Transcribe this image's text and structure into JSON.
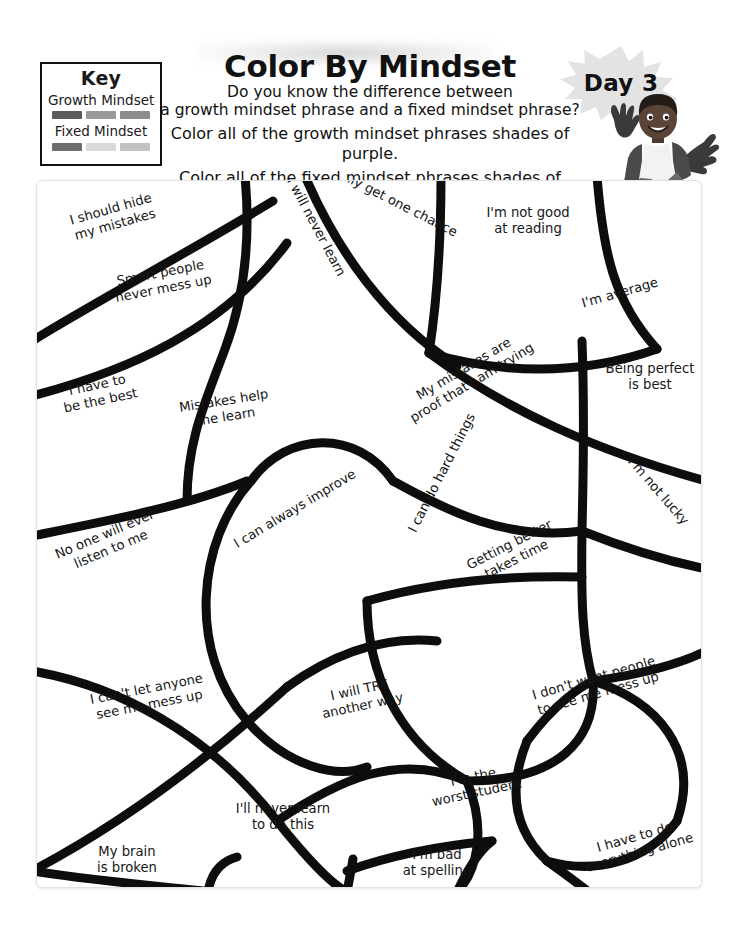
{
  "header": {
    "title": "Color By Mindset",
    "subtitle_line1": "Do you know the difference between",
    "subtitle_line2": "a growth mindset phrase and a fixed mindset phrase?",
    "instruction_line1": "Color all of the growth mindset phrases shades of purple.",
    "instruction_line2": "Color all of the fixed mindset phrases shades of blue.",
    "day_badge": "Day 3"
  },
  "key": {
    "title": "Key",
    "growth_label": "Growth Mindset",
    "fixed_label": "Fixed Mindset",
    "growth_swatches": [
      "#5b5b5b",
      "#9a9a9a",
      "#8d8d8d"
    ],
    "fixed_swatches": [
      "#6d6d6d",
      "#d9d9d9",
      "#c2c2c2"
    ]
  },
  "puzzle": {
    "regions": [
      {
        "text": "I should hide\nmy mistakes",
        "type": "fixed",
        "x": 52,
        "y": 200,
        "w": 120,
        "rot": -16
      },
      {
        "text": "Smart people\nnever mess up",
        "type": "fixed",
        "x": 96,
        "y": 264,
        "w": 130,
        "rot": -11
      },
      {
        "text": "I will never learn",
        "type": "fixed",
        "x": 250,
        "y": 218,
        "w": 130,
        "rot": 62
      },
      {
        "text": "I only get one chance",
        "type": "fixed",
        "x": 312,
        "y": 192,
        "w": 160,
        "rot": 27
      },
      {
        "text": "I'm not good\nat reading",
        "type": "fixed",
        "x": 467,
        "y": 204,
        "w": 120,
        "rot": 0
      },
      {
        "text": "I'm average",
        "type": "fixed",
        "x": 569,
        "y": 284,
        "w": 100,
        "rot": -16
      },
      {
        "text": "I have to\nbe the best",
        "type": "fixed",
        "x": 46,
        "y": 376,
        "w": 104,
        "rot": -12
      },
      {
        "text": "Mistakes help\nme learn",
        "type": "growth",
        "x": 159,
        "y": 392,
        "w": 130,
        "rot": -9
      },
      {
        "text": "My mistakes are\nproof that I am trying",
        "type": "growth",
        "x": 387,
        "y": 359,
        "w": 160,
        "rot": -31
      },
      {
        "text": "Being perfect\nis best",
        "type": "fixed",
        "x": 589,
        "y": 360,
        "w": 120,
        "rot": 0
      },
      {
        "text": "No one will ever\nlisten to me",
        "type": "fixed",
        "x": 42,
        "y": 525,
        "w": 130,
        "rot": -23
      },
      {
        "text": "I can always improve",
        "type": "growth",
        "x": 214,
        "y": 500,
        "w": 160,
        "rot": -31
      },
      {
        "text": "I can do hard things",
        "type": "growth",
        "x": 366,
        "y": 464,
        "w": 150,
        "rot": -63
      },
      {
        "text": "Getting better\ntakes time",
        "type": "growth",
        "x": 452,
        "y": 535,
        "w": 120,
        "rot": -27
      },
      {
        "text": "I'm not lucky",
        "type": "fixed",
        "x": 605,
        "y": 482,
        "w": 104,
        "rot": 49
      },
      {
        "text": "I can't let anyone\nsee me mess up",
        "type": "fixed",
        "x": 76,
        "y": 680,
        "w": 142,
        "rot": -11
      },
      {
        "text": "I will TRY\nanother way",
        "type": "growth",
        "x": 304,
        "y": 681,
        "w": 112,
        "rot": -12
      },
      {
        "text": "I don't want people\nto see me mess up",
        "type": "fixed",
        "x": 520,
        "y": 669,
        "w": 150,
        "rot": -16
      },
      {
        "text": "I'll never learn\nto do this",
        "type": "fixed",
        "x": 220,
        "y": 800,
        "w": 124,
        "rot": 0
      },
      {
        "text": "I'm the\nworst student",
        "type": "fixed",
        "x": 421,
        "y": 768,
        "w": 106,
        "rot": -12
      },
      {
        "text": "My brain\nis broken",
        "type": "fixed",
        "x": 78,
        "y": 843,
        "w": 96,
        "rot": 0
      },
      {
        "text": "I'm bad\nat spelling",
        "type": "fixed",
        "x": 389,
        "y": 846,
        "w": 94,
        "rot": 0
      },
      {
        "text": "I have to do\neverything alone",
        "type": "fixed",
        "x": 572,
        "y": 828,
        "w": 128,
        "rot": -16
      }
    ]
  }
}
